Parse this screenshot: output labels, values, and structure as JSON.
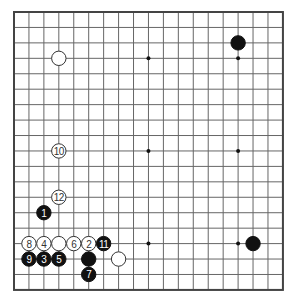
{
  "diagram": {
    "type": "go-board",
    "size": 19,
    "origin": {
      "x": 14,
      "y": 12
    },
    "spacing": {
      "x": 14.94,
      "y": 15.44
    },
    "colors": {
      "background": "#ffffff",
      "grid_line": "#666666",
      "border": "#444444",
      "black_stone": "#111111",
      "white_stone": "#ffffff",
      "white_stone_outline": "#333333",
      "black_label": "#ffffff",
      "white_label": "#333333"
    },
    "star_points": [
      {
        "col": 3,
        "row": 3
      },
      {
        "col": 9,
        "row": 3
      },
      {
        "col": 15,
        "row": 3
      },
      {
        "col": 3,
        "row": 9
      },
      {
        "col": 9,
        "row": 9
      },
      {
        "col": 15,
        "row": 9
      },
      {
        "col": 3,
        "row": 15
      },
      {
        "col": 9,
        "row": 15
      },
      {
        "col": 15,
        "row": 15
      }
    ],
    "stones": [
      {
        "color": "white",
        "col": 3,
        "row": 3,
        "label": ""
      },
      {
        "color": "black",
        "col": 15,
        "row": 2,
        "label": ""
      },
      {
        "color": "black",
        "col": 16,
        "row": 15,
        "label": ""
      },
      {
        "color": "white",
        "col": 3,
        "row": 9,
        "label": "10"
      },
      {
        "color": "white",
        "col": 3,
        "row": 12,
        "label": "12"
      },
      {
        "color": "black",
        "col": 2,
        "row": 13,
        "label": "1"
      },
      {
        "color": "white",
        "col": 1,
        "row": 15,
        "label": "8"
      },
      {
        "color": "white",
        "col": 2,
        "row": 15,
        "label": "4"
      },
      {
        "color": "white",
        "col": 3,
        "row": 15,
        "label": ""
      },
      {
        "color": "white",
        "col": 4,
        "row": 15,
        "label": "6"
      },
      {
        "color": "white",
        "col": 5,
        "row": 15,
        "label": "2"
      },
      {
        "color": "black",
        "col": 6,
        "row": 15,
        "label": "11"
      },
      {
        "color": "black",
        "col": 1,
        "row": 16,
        "label": "9"
      },
      {
        "color": "black",
        "col": 2,
        "row": 16,
        "label": "3"
      },
      {
        "color": "black",
        "col": 3,
        "row": 16,
        "label": "5"
      },
      {
        "color": "black",
        "col": 5,
        "row": 16,
        "label": ""
      },
      {
        "color": "white",
        "col": 7,
        "row": 16,
        "label": ""
      },
      {
        "color": "black",
        "col": 5,
        "row": 17,
        "label": "7"
      }
    ]
  }
}
